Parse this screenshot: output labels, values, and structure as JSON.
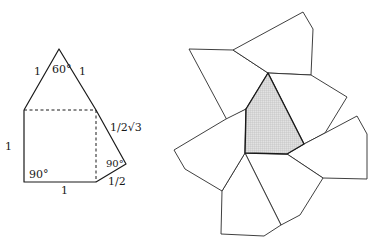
{
  "left_figure": {
    "description": "Single face of polyhedron: square of side 1 with equilateral triangle on top and right triangle on the right",
    "labels": {
      "apex_angle": "60°",
      "triangle_left_side": "1",
      "triangle_right_side": "1",
      "square_left_side": "1",
      "square_bottom": "1",
      "bottom_left_angle": "90°",
      "right_angle": "90°",
      "right_long_side": "1/2√3",
      "right_short_side": "1/2"
    }
  },
  "right_figure": {
    "description": "Net of pentagonal faces surrounding a shaded central pentagon",
    "shaded_face_count": 1,
    "face_count": 6
  }
}
